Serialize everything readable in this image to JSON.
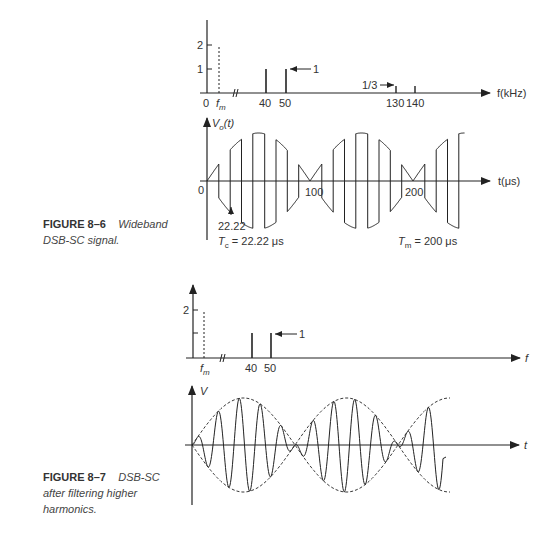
{
  "figure_8_6": {
    "caption_number": "FIGURE 8–6",
    "caption_text_1": "Wideband",
    "caption_text_2": "DSB-SC signal.",
    "spectrum": {
      "y_ticks": [
        "2",
        "1"
      ],
      "x_labels": [
        "0",
        "f",
        "m",
        "40",
        "50",
        "130",
        "140"
      ],
      "x_axis_label": "f(kHz)",
      "annotation_1": "1",
      "annotation_third": "1/3"
    },
    "waveform": {
      "y_axis_label": "V",
      "y_axis_sub": "o",
      "y_axis_suffix": "(t)",
      "origin_label": "0",
      "x_ticks": [
        "100",
        "200"
      ],
      "x_axis_label": "t(μs)",
      "marker_value": "22.22",
      "tc_label": "T",
      "tc_sub": "c",
      "tc_value": " = 22.22 μs",
      "tm_label": "T",
      "tm_sub": "m",
      "tm_value": " = 200 μs"
    }
  },
  "figure_8_7": {
    "caption_number": "FIGURE 8–7",
    "caption_text_1": "DSB-SC",
    "caption_text_2": "after filtering higher",
    "caption_text_3": "harmonics.",
    "spectrum": {
      "y_ticks": [
        "2"
      ],
      "x_labels": [
        "f",
        "m",
        "40",
        "50"
      ],
      "x_axis_label": "f",
      "annotation_1": "1"
    },
    "waveform": {
      "y_axis_label": "V",
      "x_axis_label": "t"
    }
  },
  "chart_data": [
    {
      "type": "bar",
      "title": "Wideband DSB-SC spectrum",
      "xlabel": "f(kHz)",
      "ylabel": "",
      "categories": [
        "fm",
        "40",
        "50",
        "130",
        "140"
      ],
      "values": [
        2,
        1,
        1,
        0.333,
        0.333
      ],
      "ylim": [
        0,
        2.5
      ],
      "notes": "fm line dashed (modulating signal); 1/3 marks third harmonic sidebands"
    },
    {
      "type": "line",
      "title": "Wideband DSB-SC signal Vo(t)",
      "xlabel": "t(μs)",
      "ylabel": "Vo(t)",
      "x_ticks": [
        0,
        100,
        200
      ],
      "Tc_us": 22.22,
      "Tm_us": 200
    },
    {
      "type": "bar",
      "title": "DSB-SC spectrum after filtering",
      "xlabel": "f",
      "categories": [
        "fm",
        "40",
        "50"
      ],
      "values": [
        2,
        1,
        1
      ],
      "ylim": [
        0,
        2.5
      ]
    },
    {
      "type": "line",
      "title": "DSB-SC after filtering higher harmonics",
      "xlabel": "t",
      "ylabel": "V"
    }
  ]
}
